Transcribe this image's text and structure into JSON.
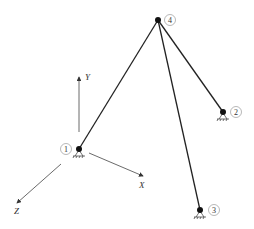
{
  "diagram": {
    "type": "3D truss / tripod structure",
    "axes": {
      "y_label": "Y",
      "x_label": "X",
      "z_label": "Z"
    },
    "nodes": [
      {
        "id": "1",
        "label": "1",
        "x": 79,
        "y": 149,
        "support": true
      },
      {
        "id": "2",
        "label": "2",
        "x": 223,
        "y": 112,
        "support": true
      },
      {
        "id": "3",
        "label": "3",
        "x": 200,
        "y": 210,
        "support": true
      },
      {
        "id": "4",
        "label": "4",
        "x": 158,
        "y": 20,
        "support": false
      }
    ],
    "members": [
      {
        "from": "4",
        "to": "1"
      },
      {
        "from": "4",
        "to": "2"
      },
      {
        "from": "4",
        "to": "3"
      }
    ],
    "colors": {
      "member": "#222222",
      "axis": "#444444",
      "node": "#111111",
      "label_circle": "#999999"
    }
  }
}
